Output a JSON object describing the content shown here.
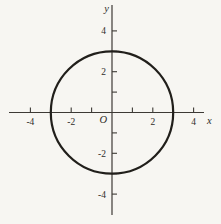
{
  "figure": {
    "type": "coordinate-plane",
    "background_color": "#f7f6f2",
    "axis_color": "#3d3a35",
    "curve_color": "#211f1b",
    "text_color": "#2f2d29",
    "x_axis": {
      "label": "x",
      "min": -4,
      "max": 4,
      "ticks": [
        -4,
        -3,
        -2,
        -1,
        1,
        2,
        3,
        4
      ],
      "labeled_ticks": [
        -4,
        -2,
        2,
        4
      ]
    },
    "y_axis": {
      "label": "y",
      "min": -4,
      "max": 4,
      "ticks": [
        -4,
        -3,
        -2,
        -1,
        1,
        2,
        3,
        4
      ],
      "labeled_ticks": [
        -4,
        -2,
        2,
        4
      ]
    },
    "origin_label": "O",
    "shapes": [
      {
        "type": "circle",
        "center_x": 0,
        "center_y": 0,
        "radius": 3
      }
    ]
  }
}
